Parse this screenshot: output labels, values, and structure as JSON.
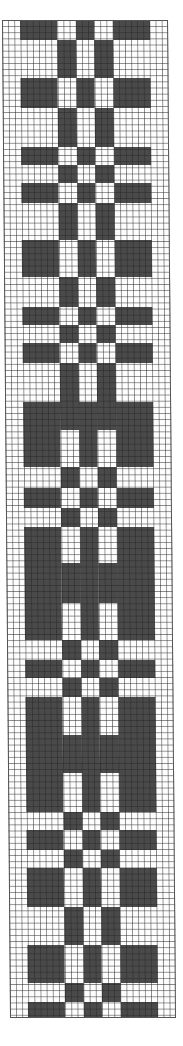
{
  "chart_data": {
    "type": "pattern-grid",
    "title": "",
    "columns": {
      "total": 27,
      "groups": [
        {
          "name": "margin-left",
          "cells": 3
        },
        {
          "name": "A",
          "cells": 6
        },
        {
          "name": "B",
          "cells": 3
        },
        {
          "name": "C",
          "cells": 3
        },
        {
          "name": "D",
          "cells": 3
        },
        {
          "name": "E",
          "cells": 6
        },
        {
          "name": "margin-right",
          "cells": 3
        }
      ]
    },
    "band_types": {
      "X": {
        "dark_groups": [
          "A",
          "C",
          "E"
        ]
      },
      "O": {
        "dark_groups": [
          "B",
          "D"
        ]
      },
      "F": {
        "dark_groups": [
          "A",
          "B",
          "C",
          "D",
          "E"
        ]
      }
    },
    "colors": {
      "dark": "#4a4a4a",
      "light": "#ffffff",
      "grid": "#555555"
    },
    "bands": [
      {
        "type": "X",
        "y0": 20,
        "y1": 40
      },
      {
        "type": "O",
        "y0": 40,
        "y1": 78
      },
      {
        "type": "X",
        "y0": 78,
        "y1": 108
      },
      {
        "type": "O",
        "y0": 108,
        "y1": 147
      },
      {
        "type": "X",
        "y0": 147,
        "y1": 165
      },
      {
        "type": "O",
        "y0": 165,
        "y1": 183
      },
      {
        "type": "X",
        "y0": 183,
        "y1": 203
      },
      {
        "type": "O",
        "y0": 203,
        "y1": 240
      },
      {
        "type": "X",
        "y0": 240,
        "y1": 277
      },
      {
        "type": "O",
        "y0": 277,
        "y1": 307
      },
      {
        "type": "X",
        "y0": 307,
        "y1": 325
      },
      {
        "type": "O",
        "y0": 325,
        "y1": 343
      },
      {
        "type": "X",
        "y0": 343,
        "y1": 363
      },
      {
        "type": "O",
        "y0": 363,
        "y1": 402
      },
      {
        "type": "F",
        "y0": 402,
        "y1": 430
      },
      {
        "type": "X",
        "y0": 430,
        "y1": 467
      },
      {
        "type": "O",
        "y0": 467,
        "y1": 488
      },
      {
        "type": "X",
        "y0": 488,
        "y1": 508
      },
      {
        "type": "O",
        "y0": 508,
        "y1": 527
      },
      {
        "type": "X",
        "y0": 527,
        "y1": 563
      },
      {
        "type": "F",
        "y0": 563,
        "y1": 603
      },
      {
        "type": "X",
        "y0": 603,
        "y1": 640
      },
      {
        "type": "O",
        "y0": 640,
        "y1": 660
      },
      {
        "type": "X",
        "y0": 660,
        "y1": 678
      },
      {
        "type": "O",
        "y0": 678,
        "y1": 697
      },
      {
        "type": "X",
        "y0": 697,
        "y1": 735
      },
      {
        "type": "F",
        "y0": 735,
        "y1": 773
      },
      {
        "type": "X",
        "y0": 773,
        "y1": 812
      },
      {
        "type": "O",
        "y0": 812,
        "y1": 830
      },
      {
        "type": "X",
        "y0": 830,
        "y1": 850
      },
      {
        "type": "O",
        "y0": 850,
        "y1": 868
      },
      {
        "type": "X",
        "y0": 868,
        "y1": 907
      },
      {
        "type": "O",
        "y0": 907,
        "y1": 945
      },
      {
        "type": "X",
        "y0": 945,
        "y1": 983
      },
      {
        "type": "O",
        "y0": 983,
        "y1": 1002
      },
      {
        "type": "X",
        "y0": 1002,
        "y1": 1018
      }
    ]
  }
}
